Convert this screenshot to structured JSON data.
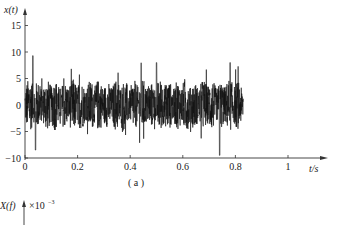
{
  "chart_data": [
    {
      "type": "line",
      "panel": "(a)",
      "title": "",
      "ylabel": "x(t)",
      "xlabel": "t/s",
      "x_ticks": [
        "0",
        "0.2",
        "0.4",
        "0.6",
        "0.8",
        "1"
      ],
      "x_tick_values": [
        0,
        0.2,
        0.4,
        0.6,
        0.8,
        1.0
      ],
      "y_ticks": [
        "-10",
        "-5",
        "0",
        "5",
        "10",
        "15"
      ],
      "y_tick_values": [
        -10,
        -5,
        0,
        5,
        10,
        15
      ],
      "xlim": [
        0,
        1.1
      ],
      "ylim": [
        -10,
        17
      ],
      "grid": false,
      "legend": null,
      "signal": {
        "description": "dense random vibration signal, zero-mean, amplitude envelope roughly ±3 to ±5 with spikes up to ~±9",
        "t_start": 0,
        "t_end": 0.83,
        "typical_amplitude": 4,
        "peak_max": 9.5,
        "peak_min": -9.5,
        "notable_peaks": [
          {
            "t": 0.03,
            "value": 9.3
          },
          {
            "t": 0.04,
            "value": -8.5
          },
          {
            "t": 0.74,
            "value": 9.8
          },
          {
            "t": 0.74,
            "value": -9.6
          },
          {
            "t": 0.5,
            "value": 8.0
          },
          {
            "t": 0.78,
            "value": 8.0
          }
        ]
      }
    },
    {
      "type": "line",
      "panel": "(b)",
      "ylabel": "X(f)",
      "y_multiplier": "×10⁻³",
      "note": "only top label visible; plot cropped"
    }
  ],
  "labels": {
    "panel_a": "( a )",
    "x_axis_title": "t/s",
    "y_axis_title_a": "x(t)",
    "y_axis_title_b": "X(f)",
    "b_multiplier": "×10",
    "b_exponent": "−3"
  },
  "colors": {
    "signal": "#111111",
    "axis": "#333333",
    "background": "#ffffff"
  }
}
